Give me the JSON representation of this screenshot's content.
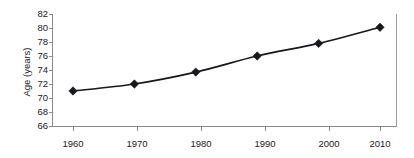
{
  "chart_data": {
    "type": "line",
    "title": "",
    "xlabel": "",
    "ylabel": "Age (years)",
    "x": [
      1960,
      1970,
      1980,
      1990,
      2000,
      2010
    ],
    "categories": [
      "1960",
      "1970",
      "1980",
      "1990",
      "2000",
      "2010"
    ],
    "values": [
      71.0,
      72.0,
      73.7,
      76.0,
      77.8,
      80.1
    ],
    "series": [
      {
        "name": "Age",
        "values": [
          71.0,
          72.0,
          73.7,
          76.0,
          77.8,
          80.1
        ]
      }
    ],
    "ylim": [
      66,
      82
    ],
    "xlim": [
      1955,
      2015
    ],
    "yticks": [
      66,
      68,
      70,
      72,
      74,
      76,
      78,
      80,
      82
    ],
    "ytick_labels": [
      "66",
      "68",
      "70",
      "72",
      "74",
      "76",
      "78",
      "80",
      "82"
    ],
    "xticks": [
      1960,
      1970,
      1980,
      1990,
      2000,
      2010
    ],
    "xtick_labels": [
      "1960",
      "1970",
      "1980",
      "1990",
      "2000",
      "2010"
    ],
    "grid": false,
    "legend": false,
    "legend_position": "none",
    "marker": "diamond",
    "line_color": "#17171c",
    "marker_color": "#17171c",
    "axis_color": "#8a8a92",
    "background_color": "#ffffff"
  }
}
